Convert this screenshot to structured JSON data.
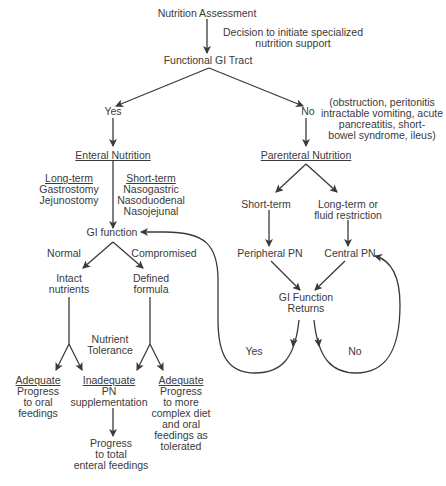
{
  "diagram": {
    "type": "flowchart",
    "colors": {
      "line": "#3a3a3a",
      "text": "#3a3a3a",
      "background": "#ffffff"
    },
    "nodes": {
      "assessment": "Nutrition Assessment",
      "decision_note": [
        "Decision to initiate specialized",
        "nutrition support"
      ],
      "functional_gi": "Functional GI Tract",
      "yes": "Yes",
      "no": "No",
      "no_reasons": [
        "(obstruction, peritonitis",
        "intractable vomiting, acute",
        "pancreatitis, short-",
        "bowel syndrome, ileus)"
      ],
      "enteral": "Enteral Nutrition",
      "long_term": {
        "heading": "Long-term",
        "items": [
          "Gastrostomy",
          "Jejunostomy"
        ]
      },
      "short_term": {
        "heading": "Short-term",
        "items": [
          "Nasogastric",
          "Nasoduodenal",
          "Nasojejunal"
        ]
      },
      "gi_function": "GI function",
      "normal": "Normal",
      "compromised": "Compromised",
      "intact": [
        "Intact",
        "nutrients"
      ],
      "defined": [
        "Defined",
        "formula"
      ],
      "nutrient_tolerance": [
        "Nutrient",
        "Tolerance"
      ],
      "adequate_left": {
        "heading": "Adequate",
        "lines": [
          "Progress",
          "to oral",
          "feedings"
        ]
      },
      "inadequate": {
        "heading": "Inadequate",
        "lines": [
          "PN",
          "supplementation"
        ]
      },
      "adequate_right": {
        "heading": "Adequate",
        "lines": [
          "Progress",
          "to more",
          "complex diet",
          "and oral",
          "feedings as",
          "tolerated"
        ]
      },
      "progress_total": [
        "Progress",
        "to total",
        "enteral feedings"
      ],
      "parenteral": "Parenteral Nutrition",
      "pn_short": "Short-term",
      "pn_long": [
        "Long-term or",
        "fluid restriction"
      ],
      "peripheral": "Peripheral PN",
      "central": "Central PN",
      "gi_returns": [
        "GI Function",
        "Returns"
      ],
      "loop_yes": "Yes",
      "loop_no": "No"
    }
  }
}
